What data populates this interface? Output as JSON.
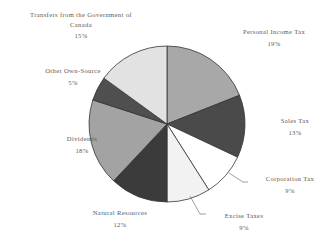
{
  "chart_data": {
    "type": "pie",
    "title": "",
    "subtitle": "",
    "xlabel": "",
    "ylabel": "",
    "legend_position": "none",
    "grid": false,
    "value_unit": "percent",
    "start_angle_deg": 0,
    "direction": "clockwise",
    "categories": [
      "Personal Income Tax",
      "Sales Tax",
      "Corporation Tax",
      "Excise Taxes",
      "Natural Resources",
      "Dividends",
      "Other Own-Source",
      "Transfers from the Government of Canada"
    ],
    "values": [
      19,
      13,
      9,
      9,
      12,
      18,
      5,
      15
    ],
    "slices": [
      {
        "label": "Personal Income Tax",
        "value": 19,
        "value_text": "19%",
        "color": "#a8a8a8"
      },
      {
        "label": "Sales Tax",
        "value": 13,
        "value_text": "13%",
        "color": "#4a4a4a"
      },
      {
        "label": "Corporation Tax",
        "value": 9,
        "value_text": "9%",
        "color": "#ffffff"
      },
      {
        "label": "Excise Taxes",
        "value": 9,
        "value_text": "9%",
        "color": "#f2f2f2"
      },
      {
        "label": "Natural Resources",
        "value": 12,
        "value_text": "12%",
        "color": "#3b3b3b"
      },
      {
        "label": "Dividends",
        "value": 18,
        "value_text": "18%",
        "color": "#a3a3a3"
      },
      {
        "label": "Other Own-Source",
        "value": 5,
        "value_text": "5%",
        "color": "#4f4f4f"
      },
      {
        "label": "Transfers from the Government of Canada",
        "value": 15,
        "value_text": "15%",
        "color": "#e2e2e2"
      }
    ]
  },
  "labels": {
    "transfers": {
      "line1": "Transfers from the Government of",
      "line2": "Canada",
      "pct": "15%"
    },
    "personal": {
      "name": "Personal Income Tax",
      "pct": "19%"
    },
    "sales": {
      "name": "Sales Tax",
      "pct": "13%"
    },
    "corporation": {
      "name": "Corporation Tax",
      "pct": "9%"
    },
    "excise": {
      "name": "Excise Taxes",
      "pct": "9%"
    },
    "natural": {
      "name": "Natural Resources",
      "pct": "12%"
    },
    "dividends": {
      "name": "Dividends",
      "pct": "18%"
    },
    "otherown": {
      "name": "Other Own-Source",
      "pct": "5%"
    }
  },
  "colors": {
    "outline": "#333333",
    "text": "#5a5a5a",
    "background": "#ffffff"
  }
}
